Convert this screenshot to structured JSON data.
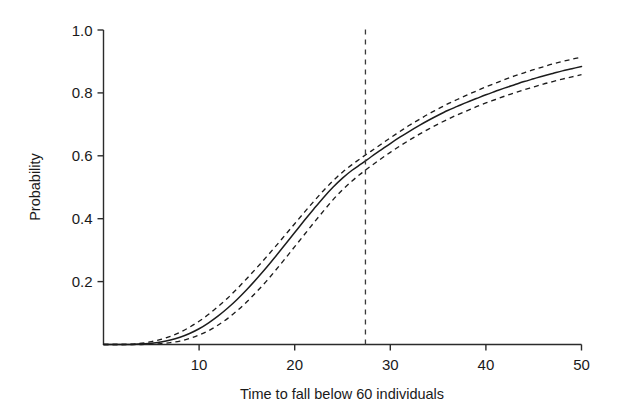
{
  "chart_data": {
    "type": "line",
    "title": "",
    "subtitle": "",
    "xlabel": "Time to fall below 60 individuals",
    "ylabel": "Probability",
    "xlim": [
      0,
      50
    ],
    "ylim": [
      0,
      1.0
    ],
    "xticks": [
      10,
      20,
      30,
      40,
      50
    ],
    "xtick_labels": [
      "10",
      "20",
      "30",
      "40",
      "50"
    ],
    "yticks": [
      0.2,
      0.4,
      0.6,
      0.8,
      1.0
    ],
    "ytick_labels": [
      "0.2",
      "0.4",
      "0.6",
      "0.8",
      "1.0"
    ],
    "grid": false,
    "legend": null,
    "x": [
      0,
      1,
      2,
      3,
      4,
      5,
      6,
      7,
      8,
      9,
      10,
      11,
      12,
      13,
      14,
      15,
      16,
      17,
      18,
      19,
      20,
      21,
      22,
      23,
      24,
      25,
      26,
      27,
      28,
      29,
      30,
      31,
      32,
      33,
      34,
      35,
      36,
      37,
      38,
      39,
      40,
      41,
      42,
      43,
      44,
      45,
      46,
      47,
      48,
      49,
      50
    ],
    "series": [
      {
        "name": "estimate",
        "style": "solid",
        "values": [
          0.0,
          0.0,
          0.0,
          0.0,
          0.002,
          0.004,
          0.008,
          0.014,
          0.023,
          0.035,
          0.05,
          0.069,
          0.091,
          0.116,
          0.144,
          0.175,
          0.208,
          0.243,
          0.28,
          0.318,
          0.356,
          0.394,
          0.431,
          0.467,
          0.5,
          0.529,
          0.554,
          0.575,
          0.597,
          0.618,
          0.639,
          0.659,
          0.678,
          0.696,
          0.713,
          0.729,
          0.744,
          0.757,
          0.77,
          0.782,
          0.794,
          0.805,
          0.816,
          0.826,
          0.836,
          0.845,
          0.854,
          0.862,
          0.87,
          0.877,
          0.884
        ]
      },
      {
        "name": "upper-confidence-band",
        "style": "dashed",
        "values": [
          0.0,
          0.0,
          0.0,
          0.001,
          0.004,
          0.009,
          0.016,
          0.026,
          0.039,
          0.055,
          0.074,
          0.096,
          0.121,
          0.148,
          0.178,
          0.21,
          0.243,
          0.277,
          0.312,
          0.348,
          0.384,
          0.42,
          0.455,
          0.489,
          0.52,
          0.548,
          0.572,
          0.594,
          0.615,
          0.636,
          0.657,
          0.677,
          0.697,
          0.715,
          0.733,
          0.749,
          0.765,
          0.779,
          0.793,
          0.806,
          0.819,
          0.831,
          0.843,
          0.854,
          0.864,
          0.874,
          0.883,
          0.892,
          0.9,
          0.907,
          0.914
        ]
      },
      {
        "name": "lower-confidence-band",
        "style": "dashed",
        "values": [
          0.0,
          0.0,
          0.0,
          0.0,
          0.0,
          0.001,
          0.003,
          0.006,
          0.011,
          0.019,
          0.03,
          0.044,
          0.062,
          0.083,
          0.108,
          0.136,
          0.167,
          0.2,
          0.236,
          0.273,
          0.311,
          0.349,
          0.387,
          0.424,
          0.46,
          0.492,
          0.52,
          0.545,
          0.568,
          0.59,
          0.611,
          0.631,
          0.65,
          0.668,
          0.685,
          0.701,
          0.716,
          0.73,
          0.743,
          0.756,
          0.768,
          0.779,
          0.79,
          0.8,
          0.81,
          0.819,
          0.828,
          0.836,
          0.844,
          0.851,
          0.858
        ]
      }
    ],
    "annotations": [
      {
        "name": "median-time-vline",
        "type": "vertical-line",
        "x": 27.4,
        "style": "dashed",
        "label": ""
      }
    ],
    "colors": {
      "curve": "#1c1c1c",
      "confidence_band": "#1c1c1c",
      "annotation_line": "#3a3a3a",
      "axis": "#2b2b2b",
      "background": "#ffffff"
    }
  }
}
